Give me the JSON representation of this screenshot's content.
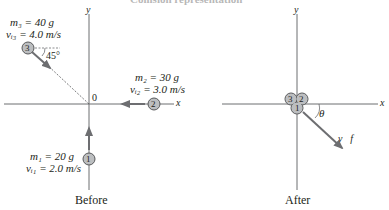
{
  "title": "Collision representation",
  "colors": {
    "axis": "#6d6e71",
    "ball_fill": "#bcbec0",
    "ball_stroke": "#58595b",
    "arrow": "#6d6e71",
    "text": "#231f20"
  },
  "before": {
    "caption": "Before",
    "axis_x": "x",
    "axis_y": "y",
    "origin": "0",
    "balls": [
      {
        "id": "1",
        "mass_label": "m₁ = 20 g",
        "velocity_label": "vᵢ₁ = 2.0 m/s",
        "direction": "+y"
      },
      {
        "id": "2",
        "mass_label": "m₂ = 30 g",
        "velocity_label": "vᵢ₂ = 3.0 m/s",
        "direction": "−x"
      },
      {
        "id": "3",
        "mass_label": "m₃ = 40 g",
        "velocity_label": "vᵢ₃ = 4.0 m/s",
        "direction": "45° below +x"
      }
    ],
    "angle_label": "45°"
  },
  "after": {
    "caption": "After",
    "axis_x": "x",
    "axis_y": "y",
    "cluster_labels": [
      "3",
      "2",
      "1"
    ],
    "velocity_label": "v⃗f",
    "angle_label": "θ"
  }
}
